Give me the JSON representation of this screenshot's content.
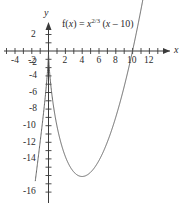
{
  "figure": {
    "equation_display": "f(x) = x^2/3 (x – 10)",
    "equation_parts": {
      "fx": "f(",
      "fx_var": "x",
      "fx_close": ") = ",
      "base": "x",
      "exponent": "2/3",
      "factor_open": " (",
      "factor_var": "x",
      "factor_rest": " – 10)"
    },
    "x_axis_name": "x",
    "y_axis_name": "y"
  },
  "chart_data": {
    "type": "line",
    "title": "",
    "annotations": [
      "f(x) = x^(2/3) (x – 10)"
    ],
    "xlabel": "x",
    "ylabel": "y",
    "xlim": [
      -5.4,
      13.6
    ],
    "ylim": [
      -17.2,
      3.2
    ],
    "grid": false,
    "legend": null,
    "x_ticks_major": [
      -4,
      -2,
      2,
      4,
      6,
      8,
      10,
      12
    ],
    "x_tick_labels": [
      "-4",
      "-2",
      "2",
      "4",
      "6",
      "8",
      "10",
      "12"
    ],
    "x_ticks_all": [
      -5,
      -4,
      -3,
      -2,
      -1,
      1,
      2,
      3,
      4,
      5,
      6,
      7,
      8,
      9,
      10,
      11,
      12,
      13
    ],
    "y_ticks_major": [
      2,
      -2,
      -4,
      -6,
      -8,
      -10,
      -12,
      -14,
      -16
    ],
    "y_tick_labels": [
      "2",
      "-2",
      "-4",
      "-6",
      "-8",
      "-10",
      "-12",
      "-14",
      "-16"
    ],
    "y_ticks_all": [
      2,
      1,
      -1,
      -2,
      -3,
      -4,
      -5,
      -6,
      -7,
      -8,
      -9,
      -10,
      -11,
      -12,
      -13,
      -14,
      -15,
      -16,
      -17
    ],
    "series": [
      {
        "name": "f(x) = x^(2/3) (x - 10)",
        "color": "#555555",
        "x": [
          -1.55,
          -1.4,
          -1.2,
          -1.0,
          -0.8,
          -0.6,
          -0.45,
          -0.3,
          -0.2,
          -0.12,
          -0.06,
          -0.02,
          0,
          0.02,
          0.06,
          0.12,
          0.2,
          0.3,
          0.45,
          0.6,
          0.8,
          1.0,
          1.3,
          1.6,
          2.0,
          2.5,
          3.0,
          3.5,
          4.0,
          4.5,
          5.0,
          5.5,
          6.0,
          6.5,
          7.0,
          7.5,
          8.0,
          8.5,
          9.0,
          9.5,
          10.0,
          10.4,
          10.8,
          11.2,
          11.5
        ],
        "y": [
          -15.8,
          -14.5,
          -12.7,
          -11.0,
          -9.3,
          -7.5,
          -6.1,
          -4.6,
          -3.5,
          -2.5,
          -1.6,
          -0.8,
          0,
          -0.8,
          -1.6,
          -2.5,
          -3.5,
          -4.6,
          -6.1,
          -7.5,
          -9.3,
          -9.0,
          -10.4,
          -11.8,
          -12.7,
          -14.0,
          -14.6,
          -15.0,
          -14.9,
          -14.4,
          -14.6,
          -13.2,
          -11.9,
          -10.2,
          -8.3,
          -6.0,
          -3.4,
          -0.5,
          2.8,
          6.4,
          0.0,
          2.1,
          4.4,
          6.9,
          8.9
        ],
        "key_points": {
          "cusp": [
            0,
            0
          ],
          "local_minimum": [
            4,
            -15.1
          ],
          "x_intercepts": [
            0,
            10
          ]
        }
      }
    ]
  }
}
